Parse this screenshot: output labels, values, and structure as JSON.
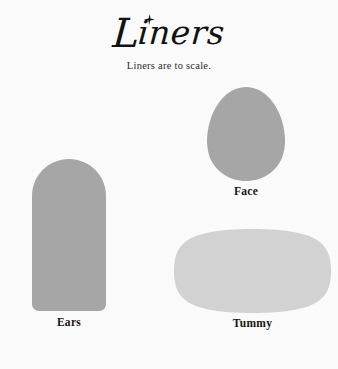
{
  "page": {
    "background_color": "#fafafa",
    "width": 338,
    "height": 369
  },
  "header": {
    "title_initial": "L",
    "title_rest": "iners",
    "title_full": "Liners",
    "sparkle_icon": "sparkle-star-icon",
    "subtitle": "Liners are to scale."
  },
  "liners": [
    {
      "id": "face",
      "label": "Face",
      "shape": "egg",
      "color": "#a6a6a6",
      "x": 206,
      "y": 87,
      "width": 80,
      "height": 94
    },
    {
      "id": "ears",
      "label": "Ears",
      "shape": "arch",
      "color": "#a6a6a6",
      "x": 32,
      "y": 159,
      "width": 74,
      "height": 152
    },
    {
      "id": "tummy",
      "label": "Tummy",
      "shape": "rounded-oval",
      "color": "#d2d2d2",
      "x": 174,
      "y": 229,
      "width": 157,
      "height": 84
    }
  ],
  "colors": {
    "background": "#fafafa",
    "shape_dark_gray": "#a6a6a6",
    "shape_light_gray": "#d2d2d2",
    "text": "#151515"
  }
}
